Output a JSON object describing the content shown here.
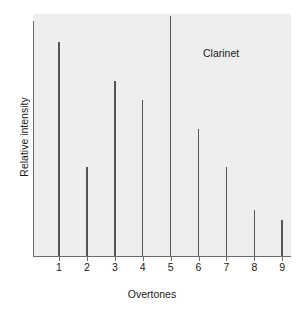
{
  "chart_data": {
    "type": "bar",
    "title": "",
    "subtitle": "",
    "xlabel": "Overtones",
    "ylabel": "Relative intensity",
    "categories": [
      "1",
      "2",
      "3",
      "4",
      "5",
      "6",
      "7",
      "8",
      "9"
    ],
    "values": [
      89,
      37,
      73,
      65,
      100,
      53,
      37,
      19,
      15
    ],
    "series": [
      {
        "name": "Clarinet",
        "values": [
          89,
          37,
          73,
          65,
          100,
          53,
          37,
          19,
          15
        ]
      }
    ],
    "ylim": [
      0,
      100
    ],
    "xlim": [
      0,
      10
    ],
    "yticks": [],
    "ytick_labels": [],
    "xticks": [
      1,
      2,
      3,
      4,
      5,
      6,
      7,
      8,
      9
    ],
    "grid": false,
    "legend": false,
    "legend_position": "none",
    "annotations": [
      {
        "text": "Clarinet",
        "x": 7.0,
        "y": 87
      }
    ],
    "colors": {
      "bar": "#555555",
      "axis": "#6b6b6b",
      "plot_background": "#eeeeee",
      "figure_background": "#ffffff",
      "text": "#1a1a1a"
    }
  },
  "axes": {
    "x_title": "Overtones",
    "y_title": "Relative intensity"
  },
  "annotation": {
    "instrument": "Clarinet"
  },
  "ticks": {
    "x": [
      {
        "label": "1"
      },
      {
        "label": "2"
      },
      {
        "label": "3"
      },
      {
        "label": "4"
      },
      {
        "label": "5"
      },
      {
        "label": "6"
      },
      {
        "label": "7"
      },
      {
        "label": "8"
      },
      {
        "label": "9"
      }
    ]
  }
}
